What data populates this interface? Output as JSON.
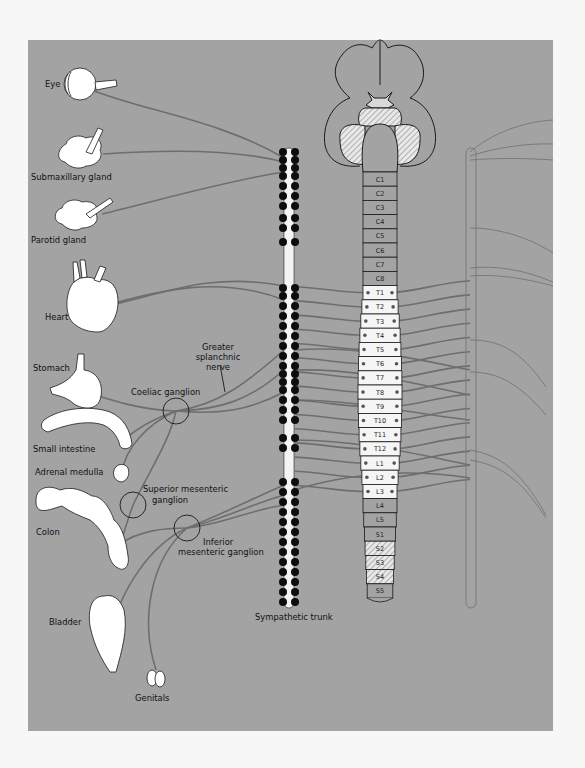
{
  "figure": {
    "panel_color": "#a3a3a3",
    "page_color": "#f7f7f7",
    "nerve_color": "#6e6e6e",
    "organ_fill": "#ffffff",
    "outline_color": "#1a1a1a"
  },
  "labels": {
    "eye": "Eye",
    "submaxillary_gland": "Submaxillary gland",
    "parotid_gland": "Parotid gland",
    "heart": "Heart",
    "stomach": "Stomach",
    "small_intestine": "Small intestine",
    "adrenal_medulla": "Adrenal medulla",
    "colon": "Colon",
    "bladder": "Bladder",
    "genitals": "Genitals",
    "coeliac_ganglion": "Coeliac ganglion",
    "greater_splanchnic_line1": "Greater",
    "greater_splanchnic_line2": "splanchnic",
    "greater_splanchnic_line3": "nerve",
    "superior_mesenteric_line1": "Superior mesenteric",
    "superior_mesenteric_line2": "ganglion",
    "inferior_mesenteric_line1": "Inferior",
    "inferior_mesenteric_line2": "mesenteric ganglion",
    "sympathetic_trunk": "Sympathetic trunk"
  },
  "spinal_cord": {
    "segments": [
      {
        "label": "C1",
        "type": "cervical"
      },
      {
        "label": "C2",
        "type": "cervical"
      },
      {
        "label": "C3",
        "type": "cervical"
      },
      {
        "label": "C4",
        "type": "cervical"
      },
      {
        "label": "C5",
        "type": "cervical"
      },
      {
        "label": "C6",
        "type": "cervical"
      },
      {
        "label": "C7",
        "type": "cervical"
      },
      {
        "label": "C8",
        "type": "cervical"
      },
      {
        "label": "T1",
        "type": "outflow"
      },
      {
        "label": "T2",
        "type": "outflow"
      },
      {
        "label": "T3",
        "type": "outflow"
      },
      {
        "label": "T4",
        "type": "outflow"
      },
      {
        "label": "T5",
        "type": "outflow"
      },
      {
        "label": "T6",
        "type": "outflow"
      },
      {
        "label": "T7",
        "type": "outflow"
      },
      {
        "label": "T8",
        "type": "outflow"
      },
      {
        "label": "T9",
        "type": "outflow"
      },
      {
        "label": "T10",
        "type": "outflow"
      },
      {
        "label": "T11",
        "type": "outflow"
      },
      {
        "label": "T12",
        "type": "outflow"
      },
      {
        "label": "L1",
        "type": "outflow"
      },
      {
        "label": "L2",
        "type": "outflow"
      },
      {
        "label": "L3",
        "type": "outflow"
      },
      {
        "label": "L4",
        "type": "plain"
      },
      {
        "label": "L5",
        "type": "plain"
      },
      {
        "label": "S1",
        "type": "plain"
      },
      {
        "label": "S2",
        "type": "hatched"
      },
      {
        "label": "S3",
        "type": "hatched"
      },
      {
        "label": "S4",
        "type": "hatched"
      },
      {
        "label": "S5",
        "type": "plain"
      }
    ]
  }
}
